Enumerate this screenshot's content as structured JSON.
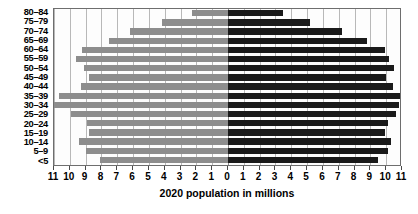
{
  "chart_data": {
    "type": "bar",
    "chart_subtype": "population-pyramid",
    "title": "",
    "xlabel": "2020 population in millions",
    "ylabel": "",
    "categories": [
      "80–84",
      "75–79",
      "70–74",
      "65–69",
      "60–64",
      "55–59",
      "50–54",
      "45–49",
      "40–44",
      "35–39",
      "30–34",
      "25–29",
      "20–24",
      "15–19",
      "10–14",
      "5–9",
      "<5"
    ],
    "series": [
      {
        "name": "left",
        "color": "#8d8d8d",
        "values": [
          2.3,
          4.2,
          6.2,
          7.5,
          9.2,
          9.6,
          9.1,
          8.8,
          9.3,
          10.7,
          11.0,
          9.9,
          8.9,
          8.8,
          9.4,
          9.0,
          8.1
        ]
      },
      {
        "name": "right",
        "color": "#1a1a1a",
        "values": [
          3.5,
          5.2,
          7.2,
          8.8,
          9.9,
          10.2,
          10.5,
          10.0,
          10.4,
          11.0,
          10.8,
          10.6,
          10.1,
          9.9,
          10.3,
          10.1,
          9.5
        ]
      }
    ],
    "xlim": [
      -11,
      11
    ],
    "xticks": [
      -11,
      -10,
      -9,
      -8,
      -7,
      -6,
      -5,
      -4,
      -3,
      -2,
      -1,
      0,
      1,
      2,
      3,
      4,
      5,
      6,
      7,
      8,
      9,
      10,
      11
    ],
    "xtick_labels": [
      "11",
      "10",
      "9",
      "8",
      "7",
      "6",
      "5",
      "4",
      "3",
      "2",
      "1",
      "0",
      "1",
      "2",
      "3",
      "4",
      "5",
      "6",
      "7",
      "8",
      "9",
      "10",
      "11"
    ],
    "grid": true,
    "legend": "none",
    "colors": {
      "left_bar": "#8d8d8d",
      "right_bar": "#1a1a1a",
      "gridline": "#b8b8b8",
      "axis": "#6e6e6e",
      "background": "#ffffff",
      "text": "#000000"
    }
  }
}
